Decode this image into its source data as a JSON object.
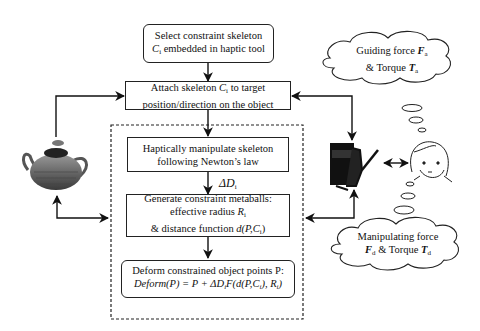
{
  "diagram": {
    "boxes": {
      "select": {
        "line1": "Select constraint skeleton",
        "line2_var": "C",
        "line2_sub": "i",
        "line2_rest": " embedded in haptic tool"
      },
      "attach": {
        "line1_pre": "Attach skeleton ",
        "line1_var": "C",
        "line1_sub": "i",
        "line1_post": " to target",
        "line2": "position/direction on the object"
      },
      "manipulate": {
        "line1": "Haptically manipulate skeleton",
        "line2": "following Newton’s law"
      },
      "generate": {
        "line1": "Generate constraint metaballs:",
        "line2_pre": "effective radius ",
        "line2_var": "R",
        "line2_sub": "i",
        "line3_pre": "& distance function ",
        "line3_var": "d(P,C",
        "line3_sub": "i",
        "line3_post": ")"
      },
      "deform": {
        "line1": "Deform constrained object points P:",
        "line2": "Deform(P) = P + ΔD",
        "line2_sub": "i",
        "line2_rest": "F(d(P,C",
        "line2_sub2": "i",
        "line2_rest2": "), R",
        "line2_sub3": "i",
        "line2_end": ")"
      }
    },
    "delta_label": {
      "text": "ΔD",
      "sub": "i"
    },
    "clouds": {
      "guiding": {
        "line1_pre": "Guiding force ",
        "line1_var": "F",
        "line1_sub": "a",
        "line2_pre": "& Torque ",
        "line2_var": "T",
        "line2_sub": "a"
      },
      "manipulating": {
        "line1": "Manipulating force",
        "line2_var1": "F",
        "line2_sub1": "d",
        "line2_mid": " & Torque ",
        "line2_var2": "T",
        "line2_sub2": "d"
      }
    },
    "images": [
      "teapot-model",
      "haptic-device",
      "user-face"
    ]
  }
}
